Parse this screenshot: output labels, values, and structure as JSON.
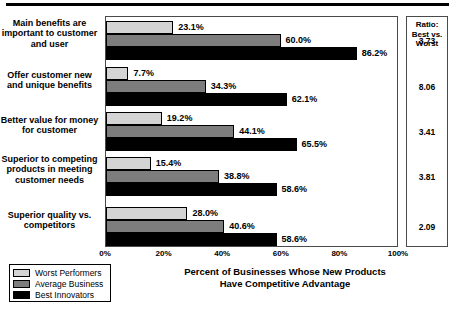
{
  "chart_data": {
    "type": "bar",
    "orientation": "horizontal",
    "title": "",
    "xlabel": "Percent of Businesses Whose New Products Have Competitive Advantage",
    "ylabel": "",
    "xlim": [
      0,
      100
    ],
    "grid": false,
    "legend_position": "bottom-left",
    "xticks": [
      "0%",
      "20%",
      "40%",
      "60%",
      "80%",
      "100%"
    ],
    "xtick_values": [
      0,
      20,
      40,
      60,
      80,
      100
    ],
    "categories": [
      "Main benefits are important to customer and user",
      "Offer customer new and unique benefits",
      "Better value for money for customer",
      "Superior to competing products in meeting customer needs",
      "Superior quality vs. competitors"
    ],
    "series": [
      {
        "name": "Worst Performers",
        "color": "#d4d4d4",
        "values": [
          23.1,
          7.7,
          19.2,
          15.4,
          28.0
        ],
        "labels": [
          "23.1%",
          "7.7%",
          "19.2%",
          "15.4%",
          "28.0%"
        ]
      },
      {
        "name": "Average Business",
        "color": "#7d7d7d",
        "values": [
          60.0,
          34.3,
          44.1,
          38.8,
          40.6
        ],
        "labels": [
          "60.0%",
          "34.3%",
          "44.1%",
          "38.8%",
          "40.6%"
        ]
      },
      {
        "name": "Best Innovators",
        "color": "#000000",
        "values": [
          86.2,
          62.1,
          65.5,
          58.6,
          58.6
        ],
        "labels": [
          "86.2%",
          "62.1%",
          "65.5%",
          "58.6%",
          "58.6%"
        ]
      }
    ],
    "annotation_column": {
      "header": "Ratio: Best vs. Worst",
      "header_lines": [
        "Ratio:",
        "Best vs.",
        "Worst"
      ],
      "values": [
        "3.73",
        "8.06",
        "3.41",
        "3.81",
        "2.09"
      ]
    }
  },
  "axis": {
    "title_lines": [
      "Percent of Businesses Whose New Products",
      "Have Competitive Advantage"
    ]
  }
}
